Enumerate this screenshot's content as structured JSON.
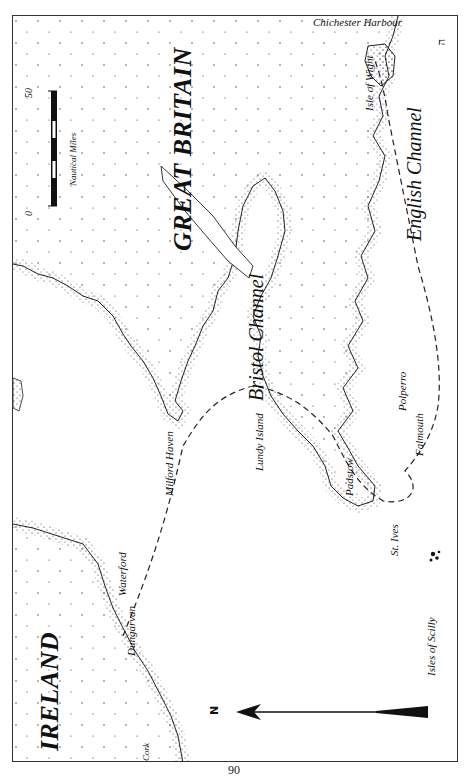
{
  "map": {
    "countries": [
      {
        "id": "great-britain",
        "label": "GREAT BRITAIN"
      },
      {
        "id": "ireland",
        "label": "IRELAND"
      }
    ],
    "seas": [
      {
        "id": "english-channel",
        "label": "English Channel"
      },
      {
        "id": "bristol-channel",
        "label": "Bristol Channel"
      }
    ],
    "places": [
      {
        "id": "chichester-harbour",
        "label": "Chichester Harbour"
      },
      {
        "id": "isle-of-wight",
        "label": "Isle of Wight"
      },
      {
        "id": "polperro",
        "label": "Polperro"
      },
      {
        "id": "falmouth",
        "label": "Falmouth"
      },
      {
        "id": "st-ives",
        "label": "St. Ives"
      },
      {
        "id": "padstow",
        "label": "Padstow"
      },
      {
        "id": "lundy-island",
        "label": "Lundy Island"
      },
      {
        "id": "milford-haven",
        "label": "Milford Haven"
      },
      {
        "id": "isles-of-scilly",
        "label": "Isles of Scilly"
      },
      {
        "id": "waterford",
        "label": "Waterford"
      },
      {
        "id": "dungarvan",
        "label": "Dungarvan"
      },
      {
        "id": "cork",
        "label": "Cork"
      }
    ],
    "scale_bar": {
      "min_label": "0",
      "max_label": "50",
      "unit_label": "Nautical Miles"
    },
    "north_arrow": {
      "label": "N"
    },
    "corner_mark": "ה"
  },
  "page": {
    "number": "90"
  }
}
